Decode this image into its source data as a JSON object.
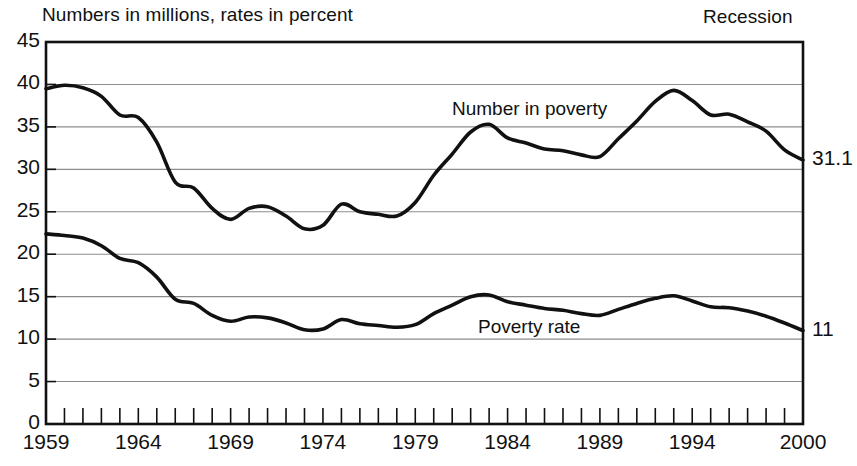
{
  "header": {
    "subtitle_note": "Numbers in millions, rates in percent",
    "recession_label": "Recession"
  },
  "labels": {
    "number_in_poverty": "Number in poverty",
    "poverty_rate": "Poverty rate",
    "end_value_number": "31.1",
    "end_value_rate": "11"
  },
  "colors": {
    "line": "#111111",
    "gridline": "#8c8c8c",
    "frame": "#111111",
    "background": "#ffffff"
  },
  "chart_data": {
    "type": "line",
    "title": "Numbers in millions, rates in percent",
    "xlabel": "",
    "ylabel": "",
    "xlim": [
      1959,
      2000
    ],
    "ylim": [
      0,
      45
    ],
    "grid": true,
    "legend": "inline-annotations",
    "ytick_labels": [
      "0",
      "5",
      "10",
      "15",
      "20",
      "25",
      "30",
      "35",
      "40",
      "45"
    ],
    "ytick_values": [
      0,
      5,
      10,
      15,
      20,
      25,
      30,
      35,
      40,
      45
    ],
    "xtick_labels": [
      "1959",
      "1964",
      "1969",
      "1974",
      "1979",
      "1984",
      "1989",
      "1994",
      "2000"
    ],
    "xtick_values": [
      1959,
      1964,
      1969,
      1974,
      1979,
      1984,
      1989,
      1994,
      2000
    ],
    "x": [
      1959,
      1960,
      1961,
      1962,
      1963,
      1964,
      1965,
      1966,
      1967,
      1968,
      1969,
      1970,
      1971,
      1972,
      1973,
      1974,
      1975,
      1976,
      1977,
      1978,
      1979,
      1980,
      1981,
      1982,
      1983,
      1984,
      1985,
      1986,
      1987,
      1988,
      1989,
      1990,
      1991,
      1992,
      1993,
      1994,
      1995,
      1996,
      1997,
      1998,
      1999,
      2000
    ],
    "series": [
      {
        "name": "Number in poverty",
        "unit": "millions",
        "end_value": 31.1,
        "values": [
          39.5,
          39.9,
          39.6,
          38.6,
          36.4,
          36.1,
          33.2,
          28.5,
          27.8,
          25.4,
          24.1,
          25.4,
          25.6,
          24.5,
          23.0,
          23.4,
          25.9,
          25.0,
          24.7,
          24.5,
          26.1,
          29.3,
          31.8,
          34.4,
          35.3,
          33.7,
          33.1,
          32.4,
          32.2,
          31.7,
          31.5,
          33.6,
          35.7,
          38.0,
          39.3,
          38.1,
          36.4,
          36.5,
          35.6,
          34.5,
          32.3,
          31.1
        ]
      },
      {
        "name": "Poverty rate",
        "unit": "percent",
        "end_value": 11.0,
        "values": [
          22.4,
          22.2,
          21.9,
          21.0,
          19.5,
          19.0,
          17.3,
          14.7,
          14.2,
          12.8,
          12.1,
          12.6,
          12.5,
          11.9,
          11.1,
          11.2,
          12.3,
          11.8,
          11.6,
          11.4,
          11.7,
          13.0,
          14.0,
          15.0,
          15.2,
          14.4,
          14.0,
          13.6,
          13.4,
          13.0,
          12.8,
          13.5,
          14.2,
          14.8,
          15.1,
          14.5,
          13.8,
          13.7,
          13.3,
          12.7,
          11.9,
          11.0
        ]
      }
    ]
  }
}
